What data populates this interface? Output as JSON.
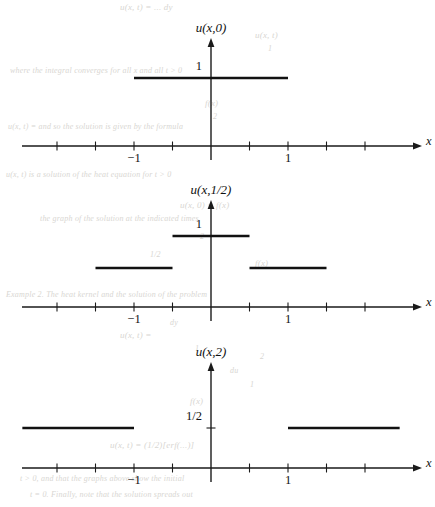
{
  "figure": {
    "type": "piecewise-step-function-plots",
    "background_bleed_text": [
      {
        "text": "u(x, t) = ...  dy",
        "x": 120,
        "y": 2,
        "size": 9
      },
      {
        "text": "u(x, t)",
        "x": 255,
        "y": 30,
        "size": 9
      },
      {
        "text": "1",
        "x": 268,
        "y": 44,
        "size": 8
      },
      {
        "text": "where the integral converges for all x and all t > 0",
        "x": 10,
        "y": 66,
        "size": 8
      },
      {
        "text": "f(x)",
        "x": 205,
        "y": 98,
        "size": 9
      },
      {
        "text": "2",
        "x": 213,
        "y": 112,
        "size": 8
      },
      {
        "text": "u(x, t) = and so the solution is given by the formula",
        "x": 8,
        "y": 122,
        "size": 8
      },
      {
        "text": "u(x, t) is a solution of the heat equation for t > 0",
        "x": 6,
        "y": 170,
        "size": 8
      },
      {
        "text": "u(x, 0) = f(x)",
        "x": 180,
        "y": 200,
        "size": 9
      },
      {
        "text": "the graph of the solution at the indicated times",
        "x": 40,
        "y": 214,
        "size": 8
      },
      {
        "text": "2",
        "x": 200,
        "y": 232,
        "size": 8
      },
      {
        "text": "1/2",
        "x": 150,
        "y": 250,
        "size": 8
      },
      {
        "text": "f(x)",
        "x": 255,
        "y": 258,
        "size": 9
      },
      {
        "text": "Example 2. The heat kernel and the solution of the problem",
        "x": 6,
        "y": 290,
        "size": 8
      },
      {
        "text": "dy",
        "x": 170,
        "y": 318,
        "size": 8
      },
      {
        "text": "u(x, t) = ",
        "x": 120,
        "y": 330,
        "size": 9
      },
      {
        "text": "1",
        "x": 195,
        "y": 344,
        "size": 8
      },
      {
        "text": "2",
        "x": 260,
        "y": 352,
        "size": 8
      },
      {
        "text": "du",
        "x": 230,
        "y": 366,
        "size": 8
      },
      {
        "text": "1",
        "x": 250,
        "y": 380,
        "size": 8
      },
      {
        "text": "f(x)",
        "x": 190,
        "y": 396,
        "size": 9
      },
      {
        "text": "u(x, t) = (1/2)[erf(...)]",
        "x": 110,
        "y": 440,
        "size": 9
      },
      {
        "text": "t > 0, and that the graphs above show the initial",
        "x": 20,
        "y": 474,
        "size": 8
      },
      {
        "text": "t = 0. Finally, note that the solution spreads out",
        "x": 30,
        "y": 490,
        "size": 8
      }
    ],
    "axes": {
      "origin_x": 211,
      "unit_px": 77,
      "tick_step_units": 0.5,
      "x_axis_label": "x",
      "x_tick_values": [
        -2.0,
        -1.5,
        -1.0,
        -0.5,
        0.5,
        1.0,
        1.5,
        2.0
      ],
      "x_labeled_ticks": [
        {
          "value": -1,
          "label": "−1"
        },
        {
          "value": 1,
          "label": "1"
        }
      ],
      "arrow": true
    },
    "plots": [
      {
        "id": "plot-u-x-0",
        "title": "u(x,0)",
        "title_parts": {
          "u": "u",
          "open": "(",
          "var": "x",
          "comma": ",",
          "time": "0",
          "close": ")"
        },
        "baseline_y": 146,
        "axis_top_y": 38,
        "y_labels": [
          {
            "text": "1",
            "value": 1,
            "y": 78
          }
        ],
        "segments": [
          {
            "x_from": -1.0,
            "x_to": 1.0,
            "level": 1,
            "y": 78
          }
        ]
      },
      {
        "id": "plot-u-x-half",
        "title": "u(x,1/2)",
        "title_parts": {
          "u": "u",
          "open": "(",
          "var": "x",
          "comma": ",",
          "time": "1/2",
          "close": ")"
        },
        "baseline_y": 307,
        "axis_top_y": 200,
        "y_labels": [
          {
            "text": "1",
            "value": 1,
            "y": 236
          }
        ],
        "segments": [
          {
            "x_from": -1.5,
            "x_to": -0.5,
            "level": 0.5,
            "y": 268
          },
          {
            "x_from": -0.5,
            "x_to": 0.5,
            "level": 1,
            "y": 236
          },
          {
            "x_from": 0.5,
            "x_to": 1.5,
            "level": 0.5,
            "y": 268
          }
        ]
      },
      {
        "id": "plot-u-x-2",
        "title": "u(x,2)",
        "title_parts": {
          "u": "u",
          "open": "(",
          "var": "x",
          "comma": ",",
          "time": "2",
          "close": ")"
        },
        "baseline_y": 468,
        "axis_top_y": 362,
        "y_labels": [
          {
            "text": "1/2",
            "value": 0.5,
            "y": 428
          }
        ],
        "segments": [
          {
            "x_from": -2.45,
            "x_to": -1.0,
            "level": 0.5,
            "y": 428
          },
          {
            "x_from": 1.0,
            "x_to": 2.45,
            "level": 0.5,
            "y": 428
          }
        ]
      }
    ],
    "colors": {
      "ink": "#111111",
      "axis": "#1a1a1a",
      "paper": "#ffffff",
      "bleed_text": "#d8d6d2"
    }
  }
}
